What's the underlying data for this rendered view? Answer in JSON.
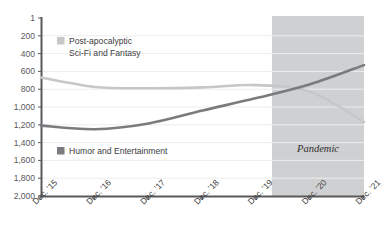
{
  "chart_data": {
    "type": "line",
    "title": "",
    "subtitle": "",
    "xlabel": "",
    "ylabel": "",
    "grid": true,
    "legend_position": "inside-plot",
    "y_axis_inverted": true,
    "ylim": [
      1,
      2000
    ],
    "yticks": [
      1,
      200,
      400,
      600,
      800,
      1000,
      1200,
      1400,
      1600,
      1800,
      2000
    ],
    "ytick_labels": [
      "1",
      "200",
      "400",
      "600",
      "800",
      "1,000",
      "1,200",
      "1,400",
      "1,600",
      "1,800",
      "2,000"
    ],
    "categories": [
      "Dec. '15",
      "Dec. '16",
      "Dec. '17",
      "Dec. '18",
      "Dec. '19",
      "Dec. '20",
      "Dec. '21"
    ],
    "xtick_labels": [
      "Dec. '15",
      "Dec. '16",
      "Dec. '17",
      "Dec. '18",
      "Dec. '19",
      "Dec. '20",
      "Dec. '21"
    ],
    "series": [
      {
        "name": "Post-apocalyptic Sci-Fi and Fantasy",
        "color": "#c6c7c9",
        "values": [
          670,
          775,
          790,
          780,
          755,
          830,
          1170
        ]
      },
      {
        "name": "Humor and Entertainment",
        "color": "#7a7b7e",
        "values": [
          1210,
          1250,
          1185,
          1040,
          900,
          745,
          530
        ]
      }
    ],
    "annotations": [
      {
        "text": "Pandemic",
        "type": "shaded-band",
        "x_start": "Dec. '19",
        "x_end": "Dec. '21",
        "band_color": "#cfd0d1"
      }
    ]
  },
  "legend": {
    "items": [
      {
        "swatch_color": "#c6c7c9",
        "line1": "Post-apocalyptic",
        "line2": "Sci-Fi and Fantasy"
      },
      {
        "swatch_color": "#7a7b7e",
        "line1": "Humor and Entertainment",
        "line2": ""
      }
    ]
  },
  "axis_style": {
    "axis_color": "#58595b",
    "grid_color": "#ededee"
  }
}
